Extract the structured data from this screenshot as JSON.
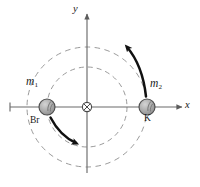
{
  "figure": {
    "background": "#ffffff",
    "width": 200,
    "height": 187
  },
  "axes": {
    "x_label": "x",
    "y_label": "y",
    "axis_color": "#6b6b6b",
    "origin": {
      "x": 87,
      "y": 107
    }
  },
  "center_of_mass": {
    "name": "center-of-mass",
    "symbol": "circle-with-cross",
    "x": 87,
    "y": 107,
    "radius": 4.5,
    "color": "#555555"
  },
  "masses": [
    {
      "id": "mass-1",
      "mass_label": "m",
      "mass_subscript": "1",
      "element_label": "Br",
      "x": 47,
      "y": 107,
      "radius": 8,
      "fill": "#a8a8a8",
      "stroke": "#4a4a4a"
    },
    {
      "id": "mass-2",
      "mass_label": "m",
      "mass_subscript": "2",
      "element_label": "K",
      "x": 147,
      "y": 107,
      "radius": 8,
      "fill": "#a8a8a8",
      "stroke": "#4a4a4a"
    }
  ],
  "orbits": [
    {
      "id": "inner-orbit",
      "center_x": 87,
      "center_y": 107,
      "radius": 40,
      "style": "dashed",
      "color": "#8f8f8f"
    },
    {
      "id": "outer-orbit",
      "center_x": 87,
      "center_y": 107,
      "radius": 60,
      "style": "dashed",
      "color": "#8f8f8f"
    }
  ],
  "motion_arrows": [
    {
      "id": "arrow-br",
      "description": "curved arrow showing Br mass rotating clockwise downward",
      "color": "#111111"
    },
    {
      "id": "arrow-k",
      "description": "curved arrow showing K mass rotating clockwise upward",
      "color": "#111111"
    }
  ]
}
